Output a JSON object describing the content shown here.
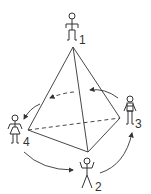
{
  "diagram": {
    "vertices": [
      {
        "id": "1",
        "label": "1",
        "figure": "person-standing"
      },
      {
        "id": "2",
        "label": "2",
        "figure": "person-arms-up"
      },
      {
        "id": "3",
        "label": "3",
        "figure": "skeleton-figure"
      },
      {
        "id": "4",
        "label": "4",
        "figure": "person-skirt"
      }
    ],
    "colors": {
      "stroke": "#333333",
      "background": "#ffffff"
    }
  }
}
